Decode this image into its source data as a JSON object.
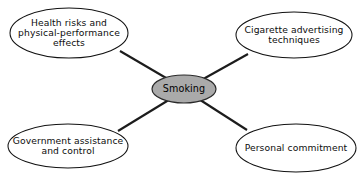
{
  "diagram": {
    "type": "cluster-web-diagram",
    "background_color": "#ffffff",
    "line_color": "#1c1c1c",
    "center": {
      "label": "Smoking",
      "fill_color": "#aaaaaa",
      "border_color": "#2a2a2a"
    },
    "branches": [
      {
        "id": "health-risks",
        "label": "Health risks and\nphysical-performance\neffects",
        "position": "top-left"
      },
      {
        "id": "advertising",
        "label": "Cigarette advertising\ntechniques",
        "position": "top-right"
      },
      {
        "id": "government",
        "label": "Government assistance\nand control",
        "position": "bottom-left"
      },
      {
        "id": "commitment",
        "label": "Personal commitment",
        "position": "bottom-right"
      }
    ],
    "caption": {
      "text": "",
      "note": "clipped at image edge"
    }
  }
}
